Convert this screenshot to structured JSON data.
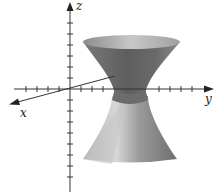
{
  "figure": {
    "axes": {
      "x_label": "x",
      "y_label": "y",
      "z_label": "z"
    },
    "colors": {
      "axis": "#333333",
      "surface_dark": "#6e6e6e",
      "surface_mid": "#9a9a9a",
      "surface_light": "#d2d2d2",
      "background": "#ffffff"
    }
  }
}
